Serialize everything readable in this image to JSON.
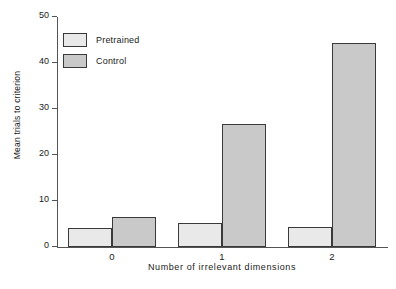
{
  "chart_data": {
    "type": "bar",
    "title": "",
    "xlabel": "Number of irrelevant dimensions",
    "ylabel": "Mean trials to criterion",
    "categories": [
      "0",
      "1",
      "2"
    ],
    "series": [
      {
        "name": "Pretrained",
        "values": [
          4.1,
          5.2,
          4.3
        ],
        "color": "#e9e9e9"
      },
      {
        "name": "Control",
        "values": [
          6.6,
          26.8,
          44.3
        ],
        "color": "#c9c9c9"
      }
    ],
    "ylim": [
      0,
      50
    ],
    "yticks": [
      0,
      10,
      20,
      30,
      40,
      50
    ],
    "ytick_labels": [
      "0",
      "10",
      "20",
      "30",
      "40",
      "50"
    ],
    "grid": false,
    "legend_position": "upper-left",
    "axis_color": "#545454",
    "bar_edge_color": "#3a3a3a"
  },
  "legend": {
    "entries": [
      {
        "label": "Pretrained"
      },
      {
        "label": "Control"
      }
    ]
  }
}
